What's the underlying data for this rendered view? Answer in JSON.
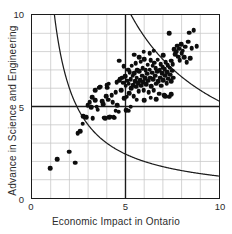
{
  "chart_data": {
    "type": "scatter",
    "title": "",
    "xlabel": "Economic Impact in Ontario",
    "ylabel": "Advance in Science and Engineering",
    "xlim": [
      0,
      10
    ],
    "ylim": [
      0,
      10
    ],
    "xticks": [
      0,
      5,
      10
    ],
    "yticks": [
      0,
      5,
      10
    ],
    "xtick_labels": [
      "0",
      "5",
      "10"
    ],
    "ytick_labels": [
      "0",
      "5",
      "10"
    ],
    "grid": true,
    "grid_step": 1,
    "grid_color": "#c9c9c9",
    "axis_color": "#1c1c1c",
    "legend": "none",
    "marker_color": "#0d0d0d",
    "marker_size": 4.6,
    "reference_lines": [
      {
        "name": "vertical-reference-line",
        "orientation": "vertical",
        "value": 5,
        "color": "#1c1c1c"
      },
      {
        "name": "horizontal-reference-line",
        "orientation": "horizontal",
        "value": 5,
        "color": "#1c1c1c"
      }
    ],
    "curves": [
      {
        "name": "lower-hyperbola",
        "equation": "x*y = 12",
        "constant": 12,
        "color": "#1c1c1c"
      },
      {
        "name": "upper-hyperbola",
        "equation": "x*y = 53",
        "constant": 53,
        "color": "#1c1c1c"
      }
    ],
    "points": [
      [
        0.95,
        1.72
      ],
      [
        1.32,
        2.2
      ],
      [
        1.98,
        2.62
      ],
      [
        2.3,
        2.02
      ],
      [
        2.42,
        3.6
      ],
      [
        2.55,
        3.72
      ],
      [
        2.68,
        4.12
      ],
      [
        2.72,
        4.52
      ],
      [
        2.88,
        4.48
      ],
      [
        2.95,
        5.12
      ],
      [
        3.05,
        5.28
      ],
      [
        3.12,
        5.02
      ],
      [
        3.18,
        5.55
      ],
      [
        3.22,
        4.42
      ],
      [
        3.35,
        5.95
      ],
      [
        3.42,
        5.05
      ],
      [
        3.48,
        4.88
      ],
      [
        3.55,
        6.08
      ],
      [
        3.62,
        6.12
      ],
      [
        3.7,
        5.35
      ],
      [
        3.76,
        5.18
      ],
      [
        3.82,
        4.45
      ],
      [
        3.88,
        4.42
      ],
      [
        3.92,
        5.62
      ],
      [
        3.98,
        6.08
      ],
      [
        4.02,
        5.42
      ],
      [
        4.08,
        4.48
      ],
      [
        4.15,
        4.5
      ],
      [
        4.22,
        5.65
      ],
      [
        4.28,
        5.28
      ],
      [
        4.32,
        4.48
      ],
      [
        4.38,
        4.45
      ],
      [
        4.42,
        5.82
      ],
      [
        4.48,
        6.38
      ],
      [
        4.52,
        5.12
      ],
      [
        4.58,
        4.78
      ],
      [
        4.62,
        6.45
      ],
      [
        4.68,
        6.55
      ],
      [
        4.72,
        5.92
      ],
      [
        4.78,
        6.62
      ],
      [
        4.82,
        6.35
      ],
      [
        4.86,
        7.22
      ],
      [
        4.88,
        5.5
      ],
      [
        4.92,
        6.7
      ],
      [
        4.95,
        6.18
      ],
      [
        4.98,
        4.85
      ],
      [
        5.02,
        5.58
      ],
      [
        5.05,
        6.45
      ],
      [
        5.08,
        7.05
      ],
      [
        5.12,
        6.28
      ],
      [
        5.15,
        5.78
      ],
      [
        5.18,
        6.92
      ],
      [
        5.22,
        6.52
      ],
      [
        5.25,
        6.05
      ],
      [
        5.28,
        7.25
      ],
      [
        5.32,
        6.72
      ],
      [
        5.35,
        6.22
      ],
      [
        5.38,
        5.62
      ],
      [
        5.42,
        6.85
      ],
      [
        5.45,
        6.42
      ],
      [
        5.48,
        7.38
      ],
      [
        5.52,
        6.12
      ],
      [
        5.55,
        6.62
      ],
      [
        5.58,
        7.02
      ],
      [
        5.62,
        6.32
      ],
      [
        5.65,
        5.88
      ],
      [
        5.68,
        6.95
      ],
      [
        5.72,
        6.48
      ],
      [
        5.75,
        7.48
      ],
      [
        5.78,
        6.18
      ],
      [
        5.82,
        6.72
      ],
      [
        5.85,
        7.12
      ],
      [
        5.88,
        6.38
      ],
      [
        5.92,
        5.95
      ],
      [
        5.95,
        7.62
      ],
      [
        5.98,
        6.58
      ],
      [
        6.02,
        7.02
      ],
      [
        6.05,
        6.25
      ],
      [
        6.08,
        6.82
      ],
      [
        6.12,
        7.32
      ],
      [
        6.15,
        6.45
      ],
      [
        6.18,
        5.82
      ],
      [
        6.22,
        7.05
      ],
      [
        6.25,
        6.62
      ],
      [
        6.28,
        7.55
      ],
      [
        6.32,
        6.15
      ],
      [
        6.35,
        6.88
      ],
      [
        6.38,
        7.25
      ],
      [
        6.42,
        6.52
      ],
      [
        6.45,
        5.92
      ],
      [
        6.48,
        7.42
      ],
      [
        6.52,
        6.72
      ],
      [
        6.55,
        7.12
      ],
      [
        6.58,
        6.28
      ],
      [
        6.62,
        6.95
      ],
      [
        6.65,
        7.58
      ],
      [
        6.68,
        6.42
      ],
      [
        6.72,
        5.75
      ],
      [
        6.75,
        7.02
      ],
      [
        6.78,
        6.62
      ],
      [
        6.82,
        7.35
      ],
      [
        6.85,
        6.18
      ],
      [
        6.88,
        6.85
      ],
      [
        6.92,
        7.18
      ],
      [
        6.95,
        6.48
      ],
      [
        6.98,
        5.68
      ],
      [
        7.02,
        7.08
      ],
      [
        7.05,
        6.72
      ],
      [
        7.08,
        7.45
      ],
      [
        7.12,
        6.32
      ],
      [
        7.15,
        6.92
      ],
      [
        7.18,
        7.28
      ],
      [
        7.22,
        6.55
      ],
      [
        7.25,
        5.58
      ],
      [
        7.28,
        7.15
      ],
      [
        7.32,
        6.78
      ],
      [
        7.35,
        7.52
      ],
      [
        7.38,
        6.42
      ],
      [
        7.42,
        6.98
      ],
      [
        7.45,
        7.35
      ],
      [
        7.48,
        6.62
      ],
      [
        7.52,
        8.15
      ],
      [
        7.58,
        7.88
      ],
      [
        7.62,
        8.02
      ],
      [
        7.68,
        8.35
      ],
      [
        7.72,
        7.75
      ],
      [
        7.78,
        8.18
      ],
      [
        7.82,
        7.55
      ],
      [
        7.88,
        8.42
      ],
      [
        7.92,
        7.92
      ],
      [
        7.98,
        8.08
      ],
      [
        8.05,
        7.72
      ],
      [
        8.12,
        8.28
      ],
      [
        8.18,
        7.45
      ],
      [
        8.25,
        8.55
      ],
      [
        8.32,
        9.05
      ],
      [
        8.38,
        7.68
      ],
      [
        8.45,
        8.22
      ],
      [
        8.55,
        9.18
      ],
      [
        8.72,
        8.32
      ],
      [
        7.25,
        9.02
      ],
      [
        6.95,
        7.82
      ],
      [
        6.45,
        8.08
      ],
      [
        6.22,
        7.92
      ],
      [
        5.92,
        8.02
      ],
      [
        5.68,
        7.72
      ],
      [
        5.42,
        7.85
      ],
      [
        4.62,
        7.52
      ],
      [
        7.05,
        5.62
      ],
      [
        7.38,
        5.72
      ],
      [
        6.58,
        5.45
      ],
      [
        6.28,
        5.52
      ],
      [
        5.95,
        5.38
      ],
      [
        5.55,
        5.42
      ],
      [
        5.22,
        5.05
      ],
      [
        5.12,
        4.82
      ],
      [
        4.42,
        4.82
      ],
      [
        4.05,
        6.28
      ],
      [
        3.95,
        6.22
      ],
      [
        3.35,
        5.38
      ]
    ]
  }
}
